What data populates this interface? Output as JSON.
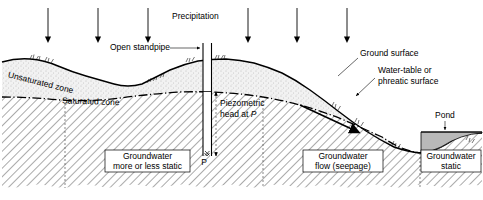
{
  "figure": {
    "width": 483,
    "height": 200
  },
  "labels": {
    "precipitation": "Precipitation",
    "open_standpipe": "Open standpipe",
    "unsaturated_zone": "Unsaturated zone",
    "saturated_zone": "Saturated zone",
    "ground_surface": "Ground surface",
    "water_table_line1": "Water-table or",
    "water_table_line2": "phreatic surface",
    "piezometric_line1": "Piezometric",
    "piezometric_line2_prefix": "head at ",
    "piezometric_point": "P",
    "point_p": "P",
    "pond": "Pond"
  },
  "zone_boxes": [
    {
      "line1": "Groundwater",
      "line2": "more or less static"
    },
    {
      "line1": "Groundwater",
      "line2": "flow (seepage)"
    },
    {
      "line1": "Groundwater",
      "line2": "static"
    }
  ],
  "colors": {
    "ink": "#000000",
    "unsaturated_fill": "#efefef",
    "saturated_hatch": "#9a9a9a",
    "pond_water": "#b9b9b9",
    "background": "#ffffff",
    "arrow": "#000000"
  },
  "precipitation_arrows": [
    {
      "x": 48
    },
    {
      "x": 98
    },
    {
      "x": 148
    },
    {
      "x": 248
    },
    {
      "x": 297
    },
    {
      "x": 347
    }
  ]
}
